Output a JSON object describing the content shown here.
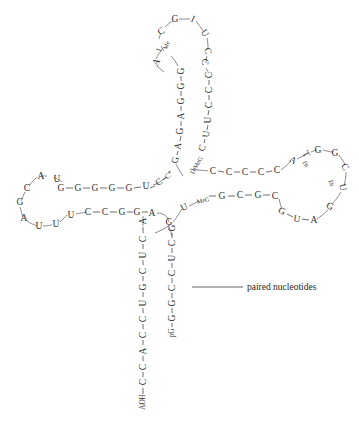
{
  "figure": {
    "annotation": {
      "label": "paired nucleotides",
      "leader_from": [
        192,
        287
      ],
      "leader_to": [
        243,
        287
      ],
      "text_x": 247,
      "text_y": 287
    },
    "ink_color": "#2f2f2f",
    "bond_color": "#4a4a4a",
    "background": "#ffffff"
  },
  "structure": {
    "acceptor_stem_5p": [
      {
        "label": "pG",
        "x": 172,
        "y": 333,
        "rot": -90,
        "cls": "small"
      },
      {
        "label": "G",
        "x": 172,
        "y": 318,
        "rot": -90,
        "cls": ""
      },
      {
        "label": "G",
        "x": 172,
        "y": 303,
        "rot": -90,
        "cls": ""
      },
      {
        "label": "C",
        "x": 172,
        "y": 288,
        "rot": -90,
        "cls": ""
      },
      {
        "label": "C",
        "x": 172,
        "y": 273,
        "rot": -90,
        "cls": ""
      },
      {
        "label": "U",
        "x": 172,
        "y": 258,
        "rot": -90,
        "cls": ""
      },
      {
        "label": "C",
        "x": 172,
        "y": 243,
        "rot": -90,
        "cls": ""
      },
      {
        "label": "G",
        "x": 172,
        "y": 228,
        "rot": -90,
        "cls": ""
      }
    ],
    "acceptor_stem_3p": [
      {
        "label": "A",
        "x": 143,
        "y": 221,
        "rot": -90,
        "cls": ""
      },
      {
        "label": "C",
        "x": 143,
        "y": 239,
        "rot": -90,
        "cls": ""
      },
      {
        "label": "U",
        "x": 143,
        "y": 255,
        "rot": -90,
        "cls": ""
      },
      {
        "label": "C",
        "x": 143,
        "y": 271,
        "rot": -90,
        "cls": ""
      },
      {
        "label": "G",
        "x": 143,
        "y": 287,
        "rot": -90,
        "cls": ""
      },
      {
        "label": "U",
        "x": 143,
        "y": 303,
        "rot": -90,
        "cls": ""
      },
      {
        "label": "C",
        "x": 143,
        "y": 319,
        "rot": -90,
        "cls": ""
      },
      {
        "label": "C",
        "x": 143,
        "y": 335,
        "rot": -90,
        "cls": ""
      },
      {
        "label": "A",
        "x": 143,
        "y": 351,
        "rot": -90,
        "cls": ""
      },
      {
        "label": "C",
        "x": 143,
        "y": 367,
        "rot": -90,
        "cls": ""
      },
      {
        "label": "C",
        "x": 143,
        "y": 382,
        "rot": -90,
        "cls": ""
      },
      {
        "label": "AOH",
        "x": 143,
        "y": 402,
        "rot": -90,
        "cls": "small"
      }
    ],
    "d_stem_upper": [
      {
        "label": "G",
        "x": 61,
        "y": 188,
        "rot": 0,
        "cls": ""
      },
      {
        "label": "G",
        "x": 78,
        "y": 188,
        "rot": 0,
        "cls": ""
      },
      {
        "label": "G",
        "x": 95,
        "y": 188,
        "rot": 0,
        "cls": ""
      },
      {
        "label": "G",
        "x": 112,
        "y": 188,
        "rot": 0,
        "cls": ""
      },
      {
        "label": "G",
        "x": 129,
        "y": 188,
        "rot": 0,
        "cls": ""
      },
      {
        "label": "U",
        "x": 146,
        "y": 186,
        "rot": 0,
        "cls": ""
      },
      {
        "label": "C",
        "x": 159,
        "y": 182,
        "rot": -35,
        "cls": ""
      },
      {
        "label": "C*",
        "x": 169,
        "y": 175,
        "rot": -55,
        "cls": "small"
      }
    ],
    "d_stem_lower": [
      {
        "label": "U",
        "x": 71,
        "y": 215,
        "rot": 0,
        "cls": ""
      },
      {
        "label": "C",
        "x": 88,
        "y": 212,
        "rot": 0,
        "cls": ""
      },
      {
        "label": "C",
        "x": 105,
        "y": 212,
        "rot": 0,
        "cls": ""
      },
      {
        "label": "G",
        "x": 122,
        "y": 212,
        "rot": 0,
        "cls": ""
      },
      {
        "label": "G",
        "x": 137,
        "y": 212,
        "rot": 0,
        "cls": ""
      },
      {
        "label": "A",
        "x": 152,
        "y": 213,
        "rot": 0,
        "cls": ""
      }
    ],
    "d_loop": [
      {
        "label": "A",
        "x": 41,
        "y": 176,
        "rot": 0,
        "cls": ""
      },
      {
        "label": "U",
        "x": 57,
        "y": 179,
        "rot": 0,
        "cls": ""
      },
      {
        "label": "C",
        "x": 27,
        "y": 188,
        "rot": 0,
        "cls": ""
      },
      {
        "label": "G",
        "x": 20,
        "y": 202,
        "rot": 0,
        "cls": ""
      },
      {
        "label": "A",
        "x": 24,
        "y": 218,
        "rot": 0,
        "cls": ""
      },
      {
        "label": "U",
        "x": 39,
        "y": 226,
        "rot": 0,
        "cls": ""
      },
      {
        "label": "U",
        "x": 56,
        "y": 224,
        "rot": 0,
        "cls": ""
      }
    ],
    "anticodon_stem_left": [
      {
        "label": "G",
        "x": 181,
        "y": 71,
        "rot": -90,
        "cls": ""
      },
      {
        "label": "G",
        "x": 181,
        "y": 86,
        "rot": -90,
        "cls": ""
      },
      {
        "label": "G",
        "x": 181,
        "y": 101,
        "rot": -90,
        "cls": ""
      },
      {
        "label": "A",
        "x": 181,
        "y": 116,
        "rot": -90,
        "cls": ""
      },
      {
        "label": "G",
        "x": 180,
        "y": 131,
        "rot": -90,
        "cls": ""
      },
      {
        "label": "A",
        "x": 178,
        "y": 146,
        "rot": -80,
        "cls": ""
      },
      {
        "label": "G",
        "x": 175,
        "y": 160,
        "rot": -70,
        "cls": ""
      }
    ],
    "anticodon_stem_right": [
      {
        "label": "C",
        "x": 209,
        "y": 75,
        "rot": -90,
        "cls": ""
      },
      {
        "label": "C",
        "x": 209,
        "y": 90,
        "rot": -90,
        "cls": ""
      },
      {
        "label": "C",
        "x": 209,
        "y": 105,
        "rot": -90,
        "cls": ""
      },
      {
        "label": "U",
        "x": 208,
        "y": 120,
        "rot": -90,
        "cls": ""
      },
      {
        "label": "U",
        "x": 206,
        "y": 134,
        "rot": -85,
        "cls": ""
      },
      {
        "label": "C",
        "x": 202,
        "y": 148,
        "rot": -70,
        "cls": ""
      },
      {
        "label": "DiMeG",
        "x": 196,
        "y": 165,
        "rot": -60,
        "cls": "tiny"
      }
    ],
    "anticodon_loop": [
      {
        "label": "Me",
        "x": 166,
        "y": 45,
        "rot": -70,
        "cls": "tiny"
      },
      {
        "label": "I",
        "x": 159,
        "y": 50,
        "rot": -70,
        "cls": "small"
      },
      {
        "label": "A",
        "x": 156,
        "y": 62,
        "rot": -60,
        "cls": ""
      },
      {
        "label": "C",
        "x": 161,
        "y": 31,
        "rot": -30,
        "cls": ""
      },
      {
        "label": "G",
        "x": 175,
        "y": 19,
        "rot": 0,
        "cls": ""
      },
      {
        "label": "I",
        "x": 193,
        "y": 19,
        "rot": 25,
        "cls": ""
      },
      {
        "label": "U",
        "x": 205,
        "y": 33,
        "rot": 55,
        "cls": ""
      },
      {
        "label": "C",
        "x": 208,
        "y": 51,
        "rot": 75,
        "cls": ""
      },
      {
        "label": "C",
        "x": 205,
        "y": 62,
        "rot": 85,
        "cls": ""
      }
    ],
    "variable_loop": [
      {
        "label": "C",
        "x": 213,
        "y": 171,
        "rot": 0,
        "cls": ""
      },
      {
        "label": "C",
        "x": 229,
        "y": 172,
        "rot": 0,
        "cls": ""
      },
      {
        "label": "C",
        "x": 245,
        "y": 172,
        "rot": 0,
        "cls": ""
      },
      {
        "label": "C",
        "x": 261,
        "y": 172,
        "rot": 0,
        "cls": ""
      },
      {
        "label": "C",
        "x": 277,
        "y": 170,
        "rot": 0,
        "cls": ""
      }
    ],
    "t_stem_upper": [
      {
        "label": "U",
        "x": 184,
        "y": 207,
        "rot": -25,
        "cls": ""
      },
      {
        "label": "MeG",
        "x": 203,
        "y": 200,
        "rot": -12,
        "cls": "tiny"
      },
      {
        "label": "G",
        "x": 222,
        "y": 196,
        "rot": 0,
        "cls": ""
      },
      {
        "label": "C",
        "x": 240,
        "y": 195,
        "rot": 0,
        "cls": ""
      },
      {
        "label": "G",
        "x": 258,
        "y": 195,
        "rot": 0,
        "cls": ""
      },
      {
        "label": "C",
        "x": 275,
        "y": 196,
        "rot": 0,
        "cls": ""
      }
    ],
    "t_stem_lower": [
      {
        "label": "G",
        "x": 169,
        "y": 222,
        "rot": 0,
        "cls": ""
      },
      {
        "label": "G",
        "x": 282,
        "y": 211,
        "rot": 25,
        "cls": ""
      },
      {
        "label": "U",
        "x": 297,
        "y": 219,
        "rot": 10,
        "cls": ""
      },
      {
        "label": "A",
        "x": 314,
        "y": 220,
        "rot": 0,
        "cls": ""
      }
    ],
    "t_loop": [
      {
        "label": "A",
        "x": 293,
        "y": 160,
        "rot": 30,
        "cls": ""
      },
      {
        "label": "T",
        "x": 306,
        "y": 154,
        "rot": 60,
        "cls": ""
      },
      {
        "label": "Di",
        "x": 306,
        "y": 164,
        "rot": 60,
        "cls": "tiny"
      },
      {
        "label": "G",
        "x": 318,
        "y": 150,
        "rot": 0,
        "cls": ""
      },
      {
        "label": "G",
        "x": 335,
        "y": 153,
        "rot": 0,
        "cls": ""
      },
      {
        "label": "C",
        "x": 345,
        "y": 167,
        "rot": 55,
        "cls": ""
      },
      {
        "label": "U",
        "x": 343,
        "y": 187,
        "rot": 80,
        "cls": ""
      },
      {
        "label": "Di",
        "x": 332,
        "y": 183,
        "rot": 70,
        "cls": "tiny"
      },
      {
        "label": "G",
        "x": 330,
        "y": 206,
        "rot": 30,
        "cls": ""
      }
    ],
    "bonds": [
      {
        "x1": 150,
        "y1": 188,
        "x2": 155,
        "y2": 186
      },
      {
        "x1": 66,
        "y1": 188,
        "x2": 73,
        "y2": 188
      },
      {
        "x1": 83,
        "y1": 188,
        "x2": 90,
        "y2": 188
      },
      {
        "x1": 100,
        "y1": 188,
        "x2": 107,
        "y2": 188
      },
      {
        "x1": 117,
        "y1": 188,
        "x2": 124,
        "y2": 188
      },
      {
        "x1": 134,
        "y1": 188,
        "x2": 141,
        "y2": 187
      },
      {
        "x1": 163,
        "y1": 180,
        "x2": 166,
        "y2": 178
      },
      {
        "x1": 93,
        "y1": 212,
        "x2": 100,
        "y2": 212
      },
      {
        "x1": 110,
        "y1": 212,
        "x2": 117,
        "y2": 212
      },
      {
        "x1": 127,
        "y1": 212,
        "x2": 133,
        "y2": 212
      },
      {
        "x1": 142,
        "y1": 212,
        "x2": 148,
        "y2": 212
      },
      {
        "x1": 209,
        "y1": 196,
        "x2": 216,
        "y2": 196
      },
      {
        "x1": 228,
        "y1": 196,
        "x2": 235,
        "y2": 196
      },
      {
        "x1": 245,
        "y1": 195,
        "x2": 252,
        "y2": 195
      },
      {
        "x1": 263,
        "y1": 195,
        "x2": 270,
        "y2": 195
      },
      {
        "x1": 302,
        "y1": 219,
        "x2": 309,
        "y2": 220
      },
      {
        "x1": 287,
        "y1": 214,
        "x2": 293,
        "y2": 217
      },
      {
        "x1": 143,
        "y1": 227,
        "x2": 143,
        "y2": 233
      },
      {
        "x1": 143,
        "y1": 244,
        "x2": 143,
        "y2": 249
      },
      {
        "x1": 143,
        "y1": 260,
        "x2": 143,
        "y2": 265
      },
      {
        "x1": 143,
        "y1": 276,
        "x2": 143,
        "y2": 281
      },
      {
        "x1": 143,
        "y1": 292,
        "x2": 143,
        "y2": 297
      },
      {
        "x1": 143,
        "y1": 308,
        "x2": 143,
        "y2": 313
      },
      {
        "x1": 143,
        "y1": 324,
        "x2": 143,
        "y2": 329
      },
      {
        "x1": 143,
        "y1": 340,
        "x2": 143,
        "y2": 345
      },
      {
        "x1": 143,
        "y1": 356,
        "x2": 143,
        "y2": 361
      },
      {
        "x1": 143,
        "y1": 372,
        "x2": 143,
        "y2": 377
      },
      {
        "x1": 143,
        "y1": 388,
        "x2": 143,
        "y2": 394
      },
      {
        "x1": 172,
        "y1": 233,
        "x2": 172,
        "y2": 238
      },
      {
        "x1": 172,
        "y1": 248,
        "x2": 172,
        "y2": 253
      },
      {
        "x1": 172,
        "y1": 263,
        "x2": 172,
        "y2": 268
      },
      {
        "x1": 172,
        "y1": 278,
        "x2": 172,
        "y2": 283
      },
      {
        "x1": 172,
        "y1": 293,
        "x2": 172,
        "y2": 298
      },
      {
        "x1": 172,
        "y1": 308,
        "x2": 172,
        "y2": 313
      },
      {
        "x1": 172,
        "y1": 323,
        "x2": 172,
        "y2": 327
      },
      {
        "x1": 181,
        "y1": 76,
        "x2": 181,
        "y2": 81
      },
      {
        "x1": 181,
        "y1": 91,
        "x2": 181,
        "y2": 96
      },
      {
        "x1": 181,
        "y1": 106,
        "x2": 181,
        "y2": 111
      },
      {
        "x1": 181,
        "y1": 121,
        "x2": 181,
        "y2": 126
      },
      {
        "x1": 181,
        "y1": 136,
        "x2": 180,
        "y2": 141
      },
      {
        "x1": 178,
        "y1": 151,
        "x2": 177,
        "y2": 155
      },
      {
        "x1": 209,
        "y1": 80,
        "x2": 209,
        "y2": 85
      },
      {
        "x1": 209,
        "y1": 95,
        "x2": 209,
        "y2": 100
      },
      {
        "x1": 209,
        "y1": 110,
        "x2": 208,
        "y2": 115
      },
      {
        "x1": 208,
        "y1": 125,
        "x2": 207,
        "y2": 130
      },
      {
        "x1": 205,
        "y1": 139,
        "x2": 204,
        "y2": 143
      },
      {
        "x1": 218,
        "y1": 171,
        "x2": 224,
        "y2": 172
      },
      {
        "x1": 234,
        "y1": 172,
        "x2": 240,
        "y2": 172
      },
      {
        "x1": 250,
        "y1": 172,
        "x2": 256,
        "y2": 172
      },
      {
        "x1": 266,
        "y1": 172,
        "x2": 272,
        "y2": 171
      }
    ],
    "curves": [
      {
        "d": "M 153,185 C 158,184 161,181 166,177"
      },
      {
        "d": "M 157,213 C 163,213 168,216 169,222"
      },
      {
        "d": "M 169,227 C 170,230 171,231 172,236"
      },
      {
        "d": "M 173,222 C 176,219 179,213 182,209"
      },
      {
        "d": "M 189,206 C 193,204 197,202 199,201"
      },
      {
        "d": "M 171,224 C 166,228 160,231 155,233"
      },
      {
        "d": "M 143,216 C 143,219 143,221 143,226"
      },
      {
        "d": "M 176,164 C 178,168 180,172 183,176"
      },
      {
        "d": "M 190,169 C 195,170 200,170 208,171"
      },
      {
        "d": "M 281,170 C 285,167 288,164 291,161"
      },
      {
        "d": "M 297,159 C 301,157 303,156 305,155"
      },
      {
        "d": "M 311,152 C 314,151 315,150 317,150"
      },
      {
        "d": "M 323,150 C 327,151 330,152 333,152"
      },
      {
        "d": "M 339,155 C 342,159 344,162 345,165"
      },
      {
        "d": "M 346,172 C 346,177 345,182 344,186"
      },
      {
        "d": "M 341,192 C 338,197 335,201 332,204"
      },
      {
        "d": "M 328,210 C 324,214 320,217 317,219"
      },
      {
        "d": "M 279,199 C 280,203 281,207 282,209"
      },
      {
        "d": "M 62,182 C 58,179 56,178 54,178"
      },
      {
        "d": "M 47,176 C 44,176 43,176 41,176"
      },
      {
        "d": "M 37,177 C 34,180 31,183 29,186"
      },
      {
        "d": "M 25,192 C 23,196 22,199 21,201"
      },
      {
        "d": "M 20,207 C 21,211 22,215 23,217"
      },
      {
        "d": "M 27,221 C 31,224 35,225 37,226"
      },
      {
        "d": "M 43,226 C 47,226 50,225 52,225"
      },
      {
        "d": "M 60,222 C 63,219 65,217 67,215"
      },
      {
        "d": "M 76,214 C 80,213 83,213 86,212"
      },
      {
        "d": "M 178,66 C 176,62 174,59 171,56"
      },
      {
        "d": "M 164,51 C 163,49 162,48 161,46"
      },
      {
        "d": "M 159,39 C 159,37 160,35 161,34"
      },
      {
        "d": "M 165,27 C 168,24 171,22 173,21"
      },
      {
        "d": "M 179,19 C 184,19 188,19 190,19"
      },
      {
        "d": "M 196,21 C 199,25 202,29 203,31"
      },
      {
        "d": "M 207,38 C 208,42 208,46 208,49"
      },
      {
        "d": "M 207,56 C 206,59 206,61 206,63"
      },
      {
        "d": "M 206,68 C 207,70 208,72 209,73"
      },
      {
        "d": "M 163,48 C 160,52 157,56 156,59"
      },
      {
        "d": "M 157,66 C 160,69 162,70 164,72"
      }
    ]
  }
}
